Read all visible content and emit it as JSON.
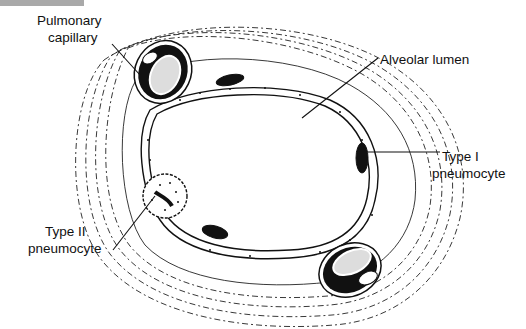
{
  "figure": {
    "type": "histology-diagram",
    "labels": {
      "pulmonary_capillary_line1": "Pulmonary",
      "pulmonary_capillary_line2": "capillary",
      "alveolar_lumen": "Alveolar lumen",
      "type1_line1": "Type I",
      "type1_line2": "pneumocyte",
      "type2_line1": "Type II",
      "type2_line2": "pneumocyte"
    },
    "colors": {
      "ink": "#111111",
      "background": "#ffffff",
      "header_bar": "#a9a9a9"
    }
  }
}
